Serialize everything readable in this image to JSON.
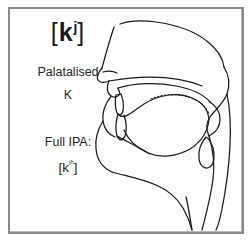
{
  "figure": {
    "name": "palatalised-k-articulation-diagram",
    "border_color": "#8a8a8a",
    "background_color": "#ffffff",
    "ink_color": "#1a1a1a"
  },
  "labels": {
    "ipa_symbol": {
      "open_bracket": "[",
      "base": "k",
      "superscript": "j",
      "close_bracket": "]"
    },
    "description_line1": "Palatalised",
    "description_line2": "K",
    "full_ipa_heading": "Full IPA:",
    "full_ipa_symbol": {
      "open_bracket": "[",
      "base": "k",
      "superscript": "ʲʰ",
      "close_bracket": "]"
    }
  },
  "diagram": {
    "type": "mid-sagittal-vocal-tract",
    "parts": [
      "nose-outline",
      "hard-palate",
      "soft-palate-velum",
      "upper-lip",
      "lower-lip",
      "teeth",
      "tongue-body",
      "tongue-tip",
      "jaw-chin-outline",
      "pharynx-wall",
      "epiglottis",
      "larynx",
      "neck-outline"
    ],
    "contact_indicator": "dotted-tongue-palate-contact"
  }
}
